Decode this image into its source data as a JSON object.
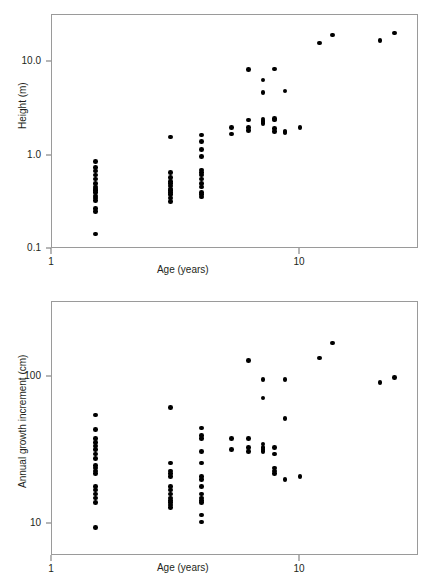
{
  "figure": {
    "background": "#ffffff",
    "point_color": "#000000",
    "axis_color": "#9a9a9a"
  },
  "chart_data": [
    {
      "type": "scatter",
      "id": "height-vs-age",
      "title": "",
      "xlabel": "Age (years)",
      "ylabel": "Height (m)",
      "xscale": "log",
      "yscale": "log",
      "xlim": [
        1.0,
        26.0
      ],
      "ylim": [
        0.1,
        26.0
      ],
      "xticks": [
        1,
        10
      ],
      "xtick_labels": [
        "1",
        "10"
      ],
      "yticks": [
        0.1,
        1.0,
        10.0
      ],
      "ytick_labels": [
        "0.1",
        "1.0",
        "10.0"
      ],
      "grid": false,
      "legend": "none",
      "x": [
        1.5,
        1.5,
        1.5,
        1.5,
        1.5,
        1.5,
        1.5,
        1.5,
        1.5,
        1.5,
        1.5,
        1.5,
        1.5,
        1.5,
        1.5,
        1.5,
        3.0,
        3.0,
        3.0,
        3.0,
        3.0,
        3.0,
        3.0,
        3.0,
        3.0,
        3.0,
        3.0,
        3.0,
        4.0,
        4.0,
        4.0,
        4.0,
        4.0,
        4.0,
        4.0,
        4.0,
        4.0,
        4.0,
        4.0,
        4.0,
        4.0,
        5.3,
        5.3,
        6.2,
        6.2,
        6.2,
        6.2,
        7.1,
        7.1,
        7.1,
        7.1,
        7.1,
        7.1,
        7.9,
        7.9,
        7.9,
        7.9,
        7.9,
        8.7,
        8.7,
        8.7,
        10.0,
        12.0,
        13.5,
        21.0,
        24.0
      ],
      "y": [
        0.86,
        0.74,
        0.68,
        0.62,
        0.56,
        0.5,
        0.46,
        0.44,
        0.42,
        0.4,
        0.37,
        0.35,
        0.33,
        0.27,
        0.25,
        0.145,
        1.58,
        0.66,
        0.58,
        0.53,
        0.5,
        0.47,
        0.44,
        0.42,
        0.4,
        0.38,
        0.35,
        0.32,
        1.66,
        1.42,
        1.16,
        0.98,
        0.7,
        0.66,
        0.62,
        0.56,
        0.5,
        0.46,
        0.4,
        0.38,
        0.36,
        2.0,
        1.7,
        8.3,
        2.4,
        2.0,
        1.85,
        6.4,
        4.7,
        2.45,
        2.35,
        2.3,
        2.2,
        8.4,
        2.5,
        2.4,
        1.95,
        1.8,
        4.9,
        1.8,
        1.75,
        2.0,
        16.0,
        19.5,
        17.0,
        20.5
      ]
    },
    {
      "type": "scatter",
      "id": "annual-growth-increment-vs-age",
      "title": "",
      "xlabel": "Age (years)",
      "ylabel": "Annual growth increment (cm)",
      "xscale": "log",
      "yscale": "log",
      "xlim": [
        1.0,
        26.0
      ],
      "ylim": [
        7.0,
        260.0
      ],
      "xticks": [
        1,
        10
      ],
      "xtick_labels": [
        "1",
        "10"
      ],
      "yticks": [
        10,
        100
      ],
      "ytick_labels": [
        "10",
        "100"
      ],
      "grid": false,
      "legend": "none",
      "x": [
        1.5,
        1.5,
        1.5,
        1.5,
        1.5,
        1.5,
        1.5,
        1.5,
        1.5,
        1.5,
        1.5,
        1.5,
        1.5,
        1.5,
        1.5,
        1.5,
        1.5,
        1.5,
        3.0,
        3.0,
        3.0,
        3.0,
        3.0,
        3.0,
        3.0,
        3.0,
        3.0,
        3.0,
        3.0,
        3.0,
        3.0,
        4.0,
        4.0,
        4.0,
        4.0,
        4.0,
        4.0,
        4.0,
        4.0,
        4.0,
        4.0,
        4.0,
        4.0,
        4.0,
        4.0,
        5.3,
        5.3,
        6.2,
        6.2,
        6.2,
        6.2,
        7.1,
        7.1,
        7.1,
        7.1,
        7.1,
        7.1,
        7.9,
        7.9,
        7.9,
        7.9,
        7.9,
        8.7,
        8.7,
        8.7,
        10.0,
        12.0,
        13.5,
        21.0,
        24.0
      ],
      "y": [
        55,
        44,
        38,
        36,
        34,
        32,
        30,
        28,
        25,
        24,
        23,
        22,
        18,
        17,
        16,
        15,
        14,
        9.5,
        62,
        26,
        23,
        22,
        21,
        18,
        17,
        16,
        15,
        14.5,
        14,
        13.5,
        13,
        45,
        40,
        38,
        31,
        26,
        21,
        20,
        18,
        16,
        15,
        14.5,
        14,
        11.5,
        10.3,
        38,
        32,
        130,
        38,
        33,
        31,
        96,
        72,
        35,
        33,
        32,
        31,
        33,
        30,
        24,
        23,
        22,
        96,
        52,
        20,
        21,
        135,
        170,
        92,
        99
      ]
    }
  ],
  "panels": [
    {
      "name": "height-panel",
      "ylabel": "Height (m)",
      "xlabel": "Age (years)",
      "ytick_labels": [
        "10.0",
        "1.0",
        "0.1"
      ],
      "xtick_labels": [
        "1",
        "10"
      ]
    },
    {
      "name": "growth-panel",
      "ylabel": "Annual growth increment (cm)",
      "xlabel": "Age (years)",
      "ytick_labels": [
        "100",
        "10"
      ],
      "xtick_labels": [
        "1",
        "10"
      ]
    }
  ]
}
